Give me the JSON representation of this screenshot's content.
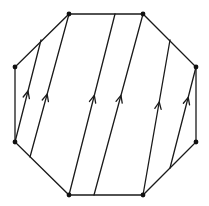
{
  "diagram": {
    "title": "",
    "type": "octagon-with-parallel-oriented-chords",
    "colors": {
      "stroke": "#1a1a1a",
      "vertex": "#111111",
      "background": "#ffffff"
    },
    "vertices": [
      {
        "id": "top-left",
        "x": 69,
        "y": 14
      },
      {
        "id": "top-right",
        "x": 143,
        "y": 14
      },
      {
        "id": "right-upper",
        "x": 196,
        "y": 67
      },
      {
        "id": "right-lower",
        "x": 196,
        "y": 142
      },
      {
        "id": "bottom-right",
        "x": 143,
        "y": 195
      },
      {
        "id": "bottom-left",
        "x": 69,
        "y": 195
      },
      {
        "id": "left-lower",
        "x": 15,
        "y": 142
      },
      {
        "id": "left-upper",
        "x": 15,
        "y": 67
      }
    ],
    "chords": [
      {
        "id": "chord-1",
        "x1": 15,
        "y1": 142,
        "x2": 41,
        "y2": 40,
        "arrow_at": 0.5,
        "direction": "up"
      },
      {
        "id": "chord-2",
        "x1": 30,
        "y1": 157,
        "x2": 69,
        "y2": 14,
        "arrow_at": 0.44,
        "direction": "up"
      },
      {
        "id": "chord-3",
        "x1": 69,
        "y1": 195,
        "x2": 115,
        "y2": 14,
        "arrow_at": 0.55,
        "direction": "up"
      },
      {
        "id": "chord-4",
        "x1": 94,
        "y1": 195,
        "x2": 143,
        "y2": 14,
        "arrow_at": 0.55,
        "direction": "up"
      },
      {
        "id": "chord-5",
        "x1": 143,
        "y1": 195,
        "x2": 170,
        "y2": 40,
        "arrow_at": 0.6,
        "direction": "up"
      },
      {
        "id": "chord-6",
        "x1": 170,
        "y1": 168,
        "x2": 196,
        "y2": 67,
        "arrow_at": 0.7,
        "direction": "up"
      }
    ]
  }
}
